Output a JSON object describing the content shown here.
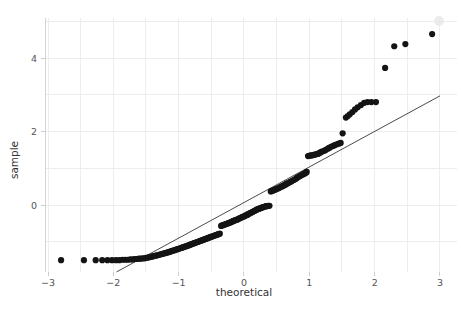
{
  "chart_data": {
    "type": "scatter",
    "title": "",
    "subtitle": "",
    "xlabel": "theoretical",
    "ylabel": "sample",
    "xlim": [
      -3.2,
      3.2
    ],
    "ylim": [
      -1.95,
      5.15
    ],
    "xticks": [
      -3,
      -2,
      -1,
      0,
      1,
      2,
      3
    ],
    "xticklabels": [
      "−3",
      "−2",
      "−1",
      "0",
      "1",
      "2",
      "3"
    ],
    "yticks": [
      0,
      2,
      4
    ],
    "yticklabels": [
      "0",
      "2",
      "4"
    ],
    "grid": true,
    "grid_minor": true,
    "legend": null,
    "legend_position": "none",
    "marker": "circle",
    "marker_color": "#141414",
    "marker_size": 3.1,
    "reference_line": {
      "label": "45-degree reference line",
      "color": "#2a2a2a",
      "x_start": -1.95,
      "y_start": -1.82,
      "x_end": 3.0,
      "y_end": 2.97,
      "slope": 0.968,
      "intercept": 0.06
    },
    "series": [
      {
        "name": "sample quantiles",
        "points": [
          [
            -2.8,
            -1.5
          ],
          [
            -2.45,
            -1.5
          ],
          [
            -2.27,
            -1.5
          ],
          [
            -2.17,
            -1.5
          ],
          [
            -2.09,
            -1.5
          ],
          [
            -2.02,
            -1.5
          ],
          [
            -1.96,
            -1.5
          ],
          [
            -1.91,
            -1.5
          ],
          [
            -1.86,
            -1.49
          ],
          [
            -1.82,
            -1.49
          ],
          [
            -1.78,
            -1.49
          ],
          [
            -1.74,
            -1.48
          ],
          [
            -1.7,
            -1.48
          ],
          [
            -1.67,
            -1.47
          ],
          [
            -1.64,
            -1.47
          ],
          [
            -1.61,
            -1.46
          ],
          [
            -1.58,
            -1.46
          ],
          [
            -1.55,
            -1.45
          ],
          [
            -1.52,
            -1.45
          ],
          [
            -1.5,
            -1.44
          ],
          [
            -1.47,
            -1.43
          ],
          [
            -1.45,
            -1.42
          ],
          [
            -1.42,
            -1.41
          ],
          [
            -1.4,
            -1.4
          ],
          [
            -1.38,
            -1.39
          ],
          [
            -1.35,
            -1.38
          ],
          [
            -1.33,
            -1.37
          ],
          [
            -1.31,
            -1.36
          ],
          [
            -1.29,
            -1.35
          ],
          [
            -1.27,
            -1.34
          ],
          [
            -1.25,
            -1.33
          ],
          [
            -1.23,
            -1.32
          ],
          [
            -1.21,
            -1.31
          ],
          [
            -1.19,
            -1.3
          ],
          [
            -1.17,
            -1.29
          ],
          [
            -1.15,
            -1.28
          ],
          [
            -1.13,
            -1.27
          ],
          [
            -1.12,
            -1.26
          ],
          [
            -1.1,
            -1.25
          ],
          [
            -1.08,
            -1.24
          ],
          [
            -1.06,
            -1.23
          ],
          [
            -1.05,
            -1.22
          ],
          [
            -1.03,
            -1.21
          ],
          [
            -1.01,
            -1.2
          ],
          [
            -1.0,
            -1.19
          ],
          [
            -0.98,
            -1.18
          ],
          [
            -0.96,
            -1.17
          ],
          [
            -0.95,
            -1.16
          ],
          [
            -0.93,
            -1.15
          ],
          [
            -0.92,
            -1.14
          ],
          [
            -0.9,
            -1.13
          ],
          [
            -0.88,
            -1.12
          ],
          [
            -0.87,
            -1.11
          ],
          [
            -0.85,
            -1.1
          ],
          [
            -0.84,
            -1.09
          ],
          [
            -0.82,
            -1.08
          ],
          [
            -0.81,
            -1.07
          ],
          [
            -0.79,
            -1.06
          ],
          [
            -0.78,
            -1.05
          ],
          [
            -0.76,
            -1.04
          ],
          [
            -0.75,
            -1.03
          ],
          [
            -0.73,
            -1.02
          ],
          [
            -0.72,
            -1.01
          ],
          [
            -0.7,
            -1.0
          ],
          [
            -0.69,
            -0.99
          ],
          [
            -0.67,
            -0.98
          ],
          [
            -0.66,
            -0.97
          ],
          [
            -0.64,
            -0.96
          ],
          [
            -0.63,
            -0.95
          ],
          [
            -0.61,
            -0.94
          ],
          [
            -0.6,
            -0.93
          ],
          [
            -0.58,
            -0.92
          ],
          [
            -0.57,
            -0.91
          ],
          [
            -0.55,
            -0.9
          ],
          [
            -0.54,
            -0.89
          ],
          [
            -0.52,
            -0.88
          ],
          [
            -0.51,
            -0.87
          ],
          [
            -0.49,
            -0.86
          ],
          [
            -0.48,
            -0.85
          ],
          [
            -0.46,
            -0.84
          ],
          [
            -0.45,
            -0.83
          ],
          [
            -0.43,
            -0.82
          ],
          [
            -0.42,
            -0.81
          ],
          [
            -0.4,
            -0.8
          ],
          [
            -0.39,
            -0.79
          ],
          [
            -0.37,
            -0.78
          ],
          [
            -0.35,
            -0.57
          ],
          [
            -0.34,
            -0.56
          ],
          [
            -0.32,
            -0.55
          ],
          [
            -0.31,
            -0.54
          ],
          [
            -0.29,
            -0.53
          ],
          [
            -0.28,
            -0.52
          ],
          [
            -0.26,
            -0.51
          ],
          [
            -0.25,
            -0.5
          ],
          [
            -0.23,
            -0.49
          ],
          [
            -0.22,
            -0.48
          ],
          [
            -0.2,
            -0.47
          ],
          [
            -0.19,
            -0.46
          ],
          [
            -0.17,
            -0.44
          ],
          [
            -0.16,
            -0.43
          ],
          [
            -0.14,
            -0.42
          ],
          [
            -0.13,
            -0.41
          ],
          [
            -0.11,
            -0.4
          ],
          [
            -0.09,
            -0.39
          ],
          [
            -0.08,
            -0.37
          ],
          [
            -0.06,
            -0.36
          ],
          [
            -0.05,
            -0.35
          ],
          [
            -0.03,
            -0.33
          ],
          [
            -0.02,
            -0.32
          ],
          [
            0.0,
            -0.31
          ],
          [
            0.02,
            -0.29
          ],
          [
            0.03,
            -0.28
          ],
          [
            0.05,
            -0.27
          ],
          [
            0.06,
            -0.25
          ],
          [
            0.08,
            -0.24
          ],
          [
            0.09,
            -0.22
          ],
          [
            0.11,
            -0.21
          ],
          [
            0.13,
            -0.19
          ],
          [
            0.14,
            -0.18
          ],
          [
            0.16,
            -0.16
          ],
          [
            0.17,
            -0.15
          ],
          [
            0.19,
            -0.13
          ],
          [
            0.2,
            -0.12
          ],
          [
            0.22,
            -0.11
          ],
          [
            0.23,
            -0.1
          ],
          [
            0.25,
            -0.09
          ],
          [
            0.26,
            -0.08
          ],
          [
            0.28,
            -0.07
          ],
          [
            0.29,
            -0.06
          ],
          [
            0.31,
            -0.05
          ],
          [
            0.33,
            -0.04
          ],
          [
            0.34,
            -0.03
          ],
          [
            0.36,
            -0.03
          ],
          [
            0.37,
            -0.02
          ],
          [
            0.39,
            -0.02
          ],
          [
            0.41,
            0.37
          ],
          [
            0.42,
            0.38
          ],
          [
            0.44,
            0.39
          ],
          [
            0.45,
            0.4
          ],
          [
            0.47,
            0.41
          ],
          [
            0.49,
            0.43
          ],
          [
            0.5,
            0.44
          ],
          [
            0.52,
            0.45
          ],
          [
            0.54,
            0.47
          ],
          [
            0.55,
            0.48
          ],
          [
            0.57,
            0.5
          ],
          [
            0.59,
            0.51
          ],
          [
            0.6,
            0.53
          ],
          [
            0.62,
            0.54
          ],
          [
            0.64,
            0.56
          ],
          [
            0.65,
            0.58
          ],
          [
            0.67,
            0.59
          ],
          [
            0.69,
            0.61
          ],
          [
            0.71,
            0.63
          ],
          [
            0.72,
            0.64
          ],
          [
            0.74,
            0.66
          ],
          [
            0.76,
            0.68
          ],
          [
            0.78,
            0.7
          ],
          [
            0.8,
            0.72
          ],
          [
            0.81,
            0.74
          ],
          [
            0.83,
            0.76
          ],
          [
            0.85,
            0.78
          ],
          [
            0.87,
            0.8
          ],
          [
            0.89,
            0.82
          ],
          [
            0.91,
            0.84
          ],
          [
            0.93,
            0.86
          ],
          [
            0.95,
            0.88
          ],
          [
            0.96,
            0.9
          ],
          [
            0.98,
            1.33
          ],
          [
            1.0,
            1.34
          ],
          [
            1.02,
            1.35
          ],
          [
            1.04,
            1.35
          ],
          [
            1.06,
            1.36
          ],
          [
            1.08,
            1.37
          ],
          [
            1.1,
            1.38
          ],
          [
            1.13,
            1.39
          ],
          [
            1.15,
            1.41
          ],
          [
            1.17,
            1.43
          ],
          [
            1.19,
            1.45
          ],
          [
            1.22,
            1.47
          ],
          [
            1.24,
            1.49
          ],
          [
            1.26,
            1.51
          ],
          [
            1.29,
            1.54
          ],
          [
            1.31,
            1.56
          ],
          [
            1.34,
            1.59
          ],
          [
            1.37,
            1.61
          ],
          [
            1.39,
            1.63
          ],
          [
            1.42,
            1.65
          ],
          [
            1.45,
            1.67
          ],
          [
            1.48,
            1.69
          ],
          [
            1.51,
            1.95
          ],
          [
            1.56,
            2.38
          ],
          [
            1.59,
            2.42
          ],
          [
            1.62,
            2.47
          ],
          [
            1.66,
            2.53
          ],
          [
            1.7,
            2.6
          ],
          [
            1.74,
            2.66
          ],
          [
            1.79,
            2.72
          ],
          [
            1.84,
            2.78
          ],
          [
            1.89,
            2.8
          ],
          [
            1.95,
            2.8
          ],
          [
            2.02,
            2.8
          ],
          [
            2.16,
            3.73
          ],
          [
            2.3,
            4.32
          ],
          [
            2.47,
            4.38
          ],
          [
            2.88,
            4.65
          ]
        ]
      }
    ],
    "notes": {
      "description": "Normal Q-Q plot of sample quantiles versus theoretical quantiles, showing a discretized/banded sample with a floor at the lower tail and heavy upper tail above the reference line.",
      "n_points": 196,
      "left_tail_floor_value": -1.5,
      "max_sample_value": 4.65,
      "min_sample_value": -1.5
    }
  },
  "axes": {
    "x_axis_title": "theoretical",
    "y_axis_title": "sample"
  }
}
